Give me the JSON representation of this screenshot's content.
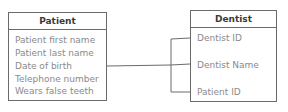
{
  "diagram": {
    "type": "entity-relationship",
    "entities": [
      {
        "name": "Patient",
        "attributes": [
          "Patient first name",
          "Patient last name",
          "Date of birth",
          "Telephone number",
          "Wears false teeth"
        ]
      },
      {
        "name": "Dentist",
        "attributes": [
          "Dentist ID",
          "Dentist Name",
          "Patient ID"
        ]
      }
    ],
    "relationships": [
      {
        "from": "Patient",
        "to": "Dentist",
        "notation": "bracket connector to all Dentist attributes"
      }
    ],
    "colors": {
      "border": "#6a6a6a",
      "header_text": "#3a3a3a",
      "attribute_text": "#8a8a8a",
      "background": "#ffffff"
    }
  }
}
